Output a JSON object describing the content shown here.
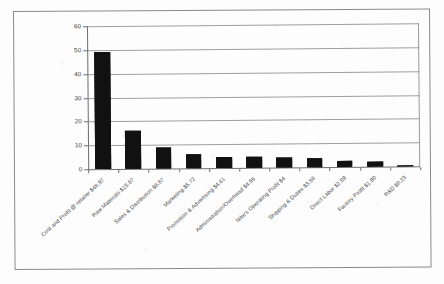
{
  "chart_data": {
    "type": "bar",
    "title": "",
    "subtitle": "",
    "xlabel": "",
    "ylabel": "",
    "ylim": [
      0,
      60
    ],
    "yticks": [
      "0",
      "10",
      "20",
      "30",
      "40",
      "50",
      "60"
    ],
    "ytick_values": [
      0,
      10,
      20,
      30,
      40,
      50,
      60
    ],
    "grid": true,
    "legend": false,
    "legend_position": "none",
    "orientation": "vertical",
    "bar_color": "#111111",
    "categories": [
      "Cost and Profit @ retailer $48.97",
      "Raw Materials $15.87",
      "Sales & Distribution $8.87",
      "Marketing $5.72",
      "Promotion & Advertising $4.61",
      "Administration/Overhead $4.56",
      "Nike's Operating Profit $4",
      "Shipping & Duties $3.88",
      "Direct Labor $2.59",
      "Factory Profit $1.90",
      "R&D $0.23"
    ],
    "values": [
      48.97,
      15.87,
      8.87,
      5.72,
      4.61,
      4.56,
      4.0,
      3.88,
      2.59,
      1.9,
      0.23
    ]
  }
}
